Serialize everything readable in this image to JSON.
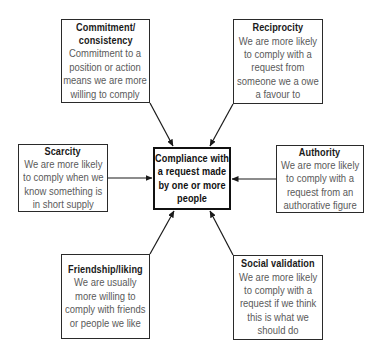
{
  "diagram": {
    "type": "hub-and-spoke",
    "center": {
      "lines": [
        "Compliance with",
        "a request made",
        "by one or more",
        "people"
      ]
    },
    "factors": [
      {
        "id": "commitment",
        "title_lines": [
          "Commitment/",
          "consistency"
        ],
        "desc_lines": [
          "Commitment to a",
          "position or action",
          "means we are more",
          "willing to comply"
        ]
      },
      {
        "id": "reciprocity",
        "title_lines": [
          "Reciprocity"
        ],
        "desc_lines": [
          "We are more likely",
          "to comply with a",
          "request from",
          "someone we a owe",
          "a favour to"
        ]
      },
      {
        "id": "scarcity",
        "title_lines": [
          "Scarcity"
        ],
        "desc_lines": [
          "We are more likely",
          "to comply when we",
          "know something is",
          "in short supply"
        ]
      },
      {
        "id": "authority",
        "title_lines": [
          "Authority"
        ],
        "desc_lines": [
          "We are more likely",
          "to comply with a",
          "request from an",
          "authorative figure"
        ]
      },
      {
        "id": "friendship",
        "title_lines": [
          "Friendship/liking"
        ],
        "desc_lines": [
          "We are usually",
          "more willing to",
          "comply with friends",
          "or people we like"
        ]
      },
      {
        "id": "social",
        "title_lines": [
          "Social validation"
        ],
        "desc_lines": [
          "We are more likely",
          "to comply with a",
          "request if we think",
          "this is what we",
          "should do"
        ]
      }
    ],
    "edges": [
      {
        "from": "commitment",
        "to": "center"
      },
      {
        "from": "reciprocity",
        "to": "center"
      },
      {
        "from": "scarcity",
        "to": "center"
      },
      {
        "from": "authority",
        "to": "center"
      },
      {
        "from": "friendship",
        "to": "center"
      },
      {
        "from": "social",
        "to": "center"
      }
    ],
    "colors": {
      "border": "#2a2a2a",
      "center_border": "#111111",
      "title_text": "#1a1a1a",
      "desc_text": "#5a5a5a",
      "arrow": "#1a1a1a",
      "background": "#ffffff"
    }
  }
}
